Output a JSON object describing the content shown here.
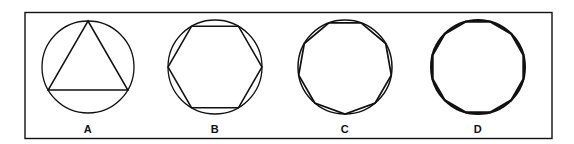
{
  "figure": {
    "background_color": "#ffffff",
    "ink_color": "#111111",
    "frame": {
      "name": "figure-border",
      "x": 25,
      "y": 12.5,
      "width": 527,
      "height": 126,
      "stroke_width": 1.4,
      "stroke_color": "#111111"
    },
    "panels": [
      {
        "label": "A",
        "shape": "inscribed-triangle",
        "sides": 3,
        "center_x": 88,
        "center_y": 67,
        "circle_radius": 46,
        "circle_stroke_width": 1.3,
        "polygon_radius": 46,
        "polygon_stroke_width": 1.5,
        "rotation_deg": 0,
        "label_x": 88,
        "label_y": 133
      },
      {
        "label": "B",
        "shape": "inscribed-hexagon",
        "sides": 6,
        "center_x": 215,
        "center_y": 67,
        "circle_radius": 47,
        "circle_stroke_width": 1.3,
        "polygon_radius": 47,
        "polygon_stroke_width": 1.5,
        "rotation_deg": 30,
        "label_x": 215,
        "label_y": 133
      },
      {
        "label": "C",
        "shape": "inscribed-nonagon",
        "sides": 9,
        "center_x": 345,
        "center_y": 67,
        "circle_radius": 47,
        "circle_stroke_width": 1.5,
        "polygon_radius": 47,
        "polygon_stroke_width": 1.7,
        "rotation_deg": 20,
        "label_x": 345,
        "label_y": 133
      },
      {
        "label": "D",
        "shape": "inscribed-dodecagon",
        "sides": 12,
        "center_x": 478,
        "center_y": 67,
        "circle_radius": 47,
        "circle_stroke_width": 2.0,
        "polygon_radius": 47,
        "polygon_stroke_width": 2.2,
        "rotation_deg": 15,
        "label_x": 478,
        "label_y": 133
      }
    ]
  }
}
